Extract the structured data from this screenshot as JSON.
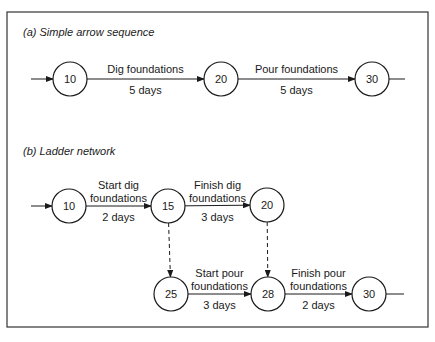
{
  "frame": {
    "x": 7,
    "y": 12,
    "w": 421,
    "h": 315,
    "color": "#333333"
  },
  "sections": [
    {
      "id": "a",
      "title": "(a) Simple arrow sequence",
      "title_pos": [
        23,
        36
      ]
    },
    {
      "id": "b",
      "title": "(b) Ladder network",
      "title_pos": [
        23,
        155
      ]
    }
  ],
  "nodes": [
    {
      "id": "a10",
      "label": "10",
      "x": 70,
      "y": 79
    },
    {
      "id": "a20",
      "label": "20",
      "x": 221,
      "y": 79
    },
    {
      "id": "a30",
      "label": "30",
      "x": 372,
      "y": 79
    },
    {
      "id": "b10",
      "label": "10",
      "x": 69,
      "y": 206
    },
    {
      "id": "b15",
      "label": "15",
      "x": 168,
      "y": 206
    },
    {
      "id": "b20",
      "label": "20",
      "x": 267,
      "y": 205
    },
    {
      "id": "b25",
      "label": "25",
      "x": 171,
      "y": 294
    },
    {
      "id": "b28",
      "label": "28",
      "x": 268,
      "y": 294
    },
    {
      "id": "b30",
      "label": "30",
      "x": 369,
      "y": 294
    }
  ],
  "activities": [
    {
      "id": "dig",
      "from": "a10",
      "to": "a20",
      "lines": [
        "Dig foundations",
        "5 days"
      ],
      "dashed": false
    },
    {
      "id": "pour",
      "from": "a20",
      "to": "a30",
      "lines": [
        "Pour foundations",
        "5 days"
      ],
      "dashed": false
    },
    {
      "id": "start-dig",
      "from": "b10",
      "to": "b15",
      "lines": [
        "Start dig",
        "foundations",
        "2 days"
      ],
      "dashed": false
    },
    {
      "id": "finish-dig",
      "from": "b15",
      "to": "b20",
      "lines": [
        "Finish dig",
        "foundations",
        "3 days"
      ],
      "dashed": false
    },
    {
      "id": "start-pour",
      "from": "b25",
      "to": "b28",
      "lines": [
        "Start pour",
        "foundations",
        "3 days"
      ],
      "dashed": false
    },
    {
      "id": "finish-pour",
      "from": "b28",
      "to": "b30",
      "lines": [
        "Finish pour",
        "foundations",
        "2 days"
      ],
      "dashed": false
    },
    {
      "id": "dummy-15-25",
      "from": "b15",
      "to": "b25",
      "lines": [],
      "dashed": true
    },
    {
      "id": "dummy-20-28",
      "from": "b20",
      "to": "b28",
      "lines": [],
      "dashed": true
    }
  ],
  "stubs": [
    {
      "id": "a-in",
      "x1": 31,
      "y1": 79,
      "to": "a10",
      "arrow": true
    },
    {
      "id": "a-out",
      "from": "a30",
      "x2": 405,
      "y2": 79,
      "arrow": false
    },
    {
      "id": "b-in",
      "x1": 31,
      "y1": 206,
      "to": "b10",
      "arrow": true
    },
    {
      "id": "b-out",
      "from": "b30",
      "x2": 404,
      "y2": 294,
      "arrow": false
    }
  ],
  "node_radius": 17
}
